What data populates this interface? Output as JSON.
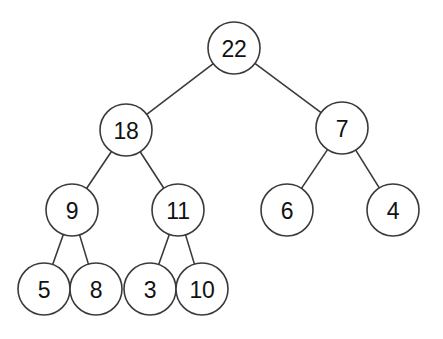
{
  "diagram": {
    "type": "binary-tree",
    "background_color": "#ffffff",
    "stroke_color": "#3a3a3a",
    "node_fill_color": "#ffffff",
    "label_color": "#111111",
    "node_radius": 26,
    "levels": 4,
    "node_count": 11,
    "edge_count": 10
  },
  "nodes": [
    {
      "id": "n22",
      "label": "22",
      "cx": 234,
      "cy": 48,
      "level": 0,
      "role": "root"
    },
    {
      "id": "n18",
      "label": "18",
      "cx": 126,
      "cy": 130,
      "level": 1,
      "role": "internal"
    },
    {
      "id": "n7",
      "label": "7",
      "cx": 342,
      "cy": 128,
      "level": 1,
      "role": "internal"
    },
    {
      "id": "n9",
      "label": "9",
      "cx": 72,
      "cy": 210,
      "level": 2,
      "role": "internal"
    },
    {
      "id": "n11",
      "label": "11",
      "cx": 178,
      "cy": 210,
      "level": 2,
      "role": "internal"
    },
    {
      "id": "n6",
      "label": "6",
      "cx": 287,
      "cy": 210,
      "level": 2,
      "role": "leaf"
    },
    {
      "id": "n4",
      "label": "4",
      "cx": 393,
      "cy": 210,
      "level": 2,
      "role": "leaf"
    },
    {
      "id": "n5",
      "label": "5",
      "cx": 44,
      "cy": 289,
      "level": 3,
      "role": "leaf"
    },
    {
      "id": "n8",
      "label": "8",
      "cx": 96,
      "cy": 289,
      "level": 3,
      "role": "leaf"
    },
    {
      "id": "n3",
      "label": "3",
      "cx": 150,
      "cy": 289,
      "level": 3,
      "role": "leaf"
    },
    {
      "id": "n10",
      "label": "10",
      "cx": 202,
      "cy": 289,
      "level": 3,
      "role": "leaf"
    }
  ],
  "edges": [
    {
      "id": "e-22-18",
      "from": "n22",
      "to": "n18",
      "side": "left"
    },
    {
      "id": "e-22-7",
      "from": "n22",
      "to": "n7",
      "side": "right"
    },
    {
      "id": "e-18-9",
      "from": "n18",
      "to": "n9",
      "side": "left"
    },
    {
      "id": "e-18-11",
      "from": "n18",
      "to": "n11",
      "side": "right"
    },
    {
      "id": "e-7-6",
      "from": "n7",
      "to": "n6",
      "side": "left"
    },
    {
      "id": "e-7-4",
      "from": "n7",
      "to": "n4",
      "side": "right"
    },
    {
      "id": "e-9-5",
      "from": "n9",
      "to": "n5",
      "side": "left"
    },
    {
      "id": "e-9-8",
      "from": "n9",
      "to": "n8",
      "side": "right"
    },
    {
      "id": "e-11-3",
      "from": "n11",
      "to": "n3",
      "side": "left"
    },
    {
      "id": "e-11-10",
      "from": "n11",
      "to": "n10",
      "side": "right"
    }
  ]
}
